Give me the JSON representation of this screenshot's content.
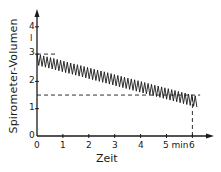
{
  "chart_data": {
    "type": "line",
    "title": "",
    "xlabel": "Zeit",
    "ylabel": "Spirometer-Volumen",
    "x_unit": "min",
    "y_unit": "l",
    "x_ticks": [
      "0",
      "1",
      "2",
      "3",
      "4",
      "5 min",
      "6"
    ],
    "y_ticks": [
      "0",
      "1",
      "2",
      "3",
      "4"
    ],
    "xlim": [
      0,
      6.8
    ],
    "ylim": [
      0,
      4.5
    ],
    "grid": false,
    "legend": null,
    "series": [
      {
        "name": "Atemzüge (Spirometer-Volumen)",
        "description": "oscillating breathing trace with declining baseline",
        "upper_envelope": {
          "x": [
            0,
            6.2
          ],
          "y": [
            3.0,
            1.45
          ]
        },
        "lower_envelope": {
          "x": [
            0,
            6.2
          ],
          "y": [
            2.6,
            1.05
          ]
        },
        "cycle_period_min": 0.13
      }
    ],
    "reference_lines": [
      {
        "orientation": "horizontal",
        "y": 3.0,
        "x_range": [
          0,
          0.8
        ],
        "style": "dashed"
      },
      {
        "orientation": "horizontal",
        "y": 1.5,
        "x_range": [
          0,
          6.3
        ],
        "style": "dashed"
      },
      {
        "orientation": "vertical",
        "x": 6.0,
        "y_range": [
          0,
          1.5
        ],
        "style": "dashed"
      }
    ]
  },
  "labels": {
    "ylabel": "Spirometer-Volumen",
    "xlabel": "Zeit",
    "y_unit": "l",
    "x_ticks": [
      "0",
      "1",
      "2",
      "3",
      "4",
      "5 min",
      "6"
    ],
    "y_ticks": [
      "0",
      "1",
      "2",
      "3",
      "4"
    ]
  }
}
